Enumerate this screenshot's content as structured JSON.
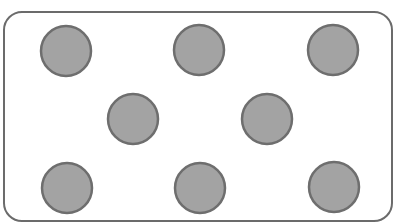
{
  "diagram": {
    "frame": {
      "x": 4,
      "y": 12,
      "width": 388,
      "height": 209,
      "radius": 18,
      "stroke": "#6b6b6b",
      "stroke_width": 2,
      "fill": "#ffffff"
    },
    "dot_style": {
      "radius": 25,
      "fill": "#a3a3a3",
      "stroke": "#6e6e6e",
      "stroke_width": 2.5
    },
    "dots": [
      {
        "row": 1,
        "cx": 66,
        "cy": 51
      },
      {
        "row": 1,
        "cx": 199,
        "cy": 50
      },
      {
        "row": 1,
        "cx": 333,
        "cy": 50
      },
      {
        "row": 2,
        "cx": 133,
        "cy": 119
      },
      {
        "row": 2,
        "cx": 267,
        "cy": 119
      },
      {
        "row": 3,
        "cx": 67,
        "cy": 188
      },
      {
        "row": 3,
        "cx": 200,
        "cy": 188
      },
      {
        "row": 3,
        "cx": 334,
        "cy": 187
      }
    ],
    "dot_count": 8
  }
}
